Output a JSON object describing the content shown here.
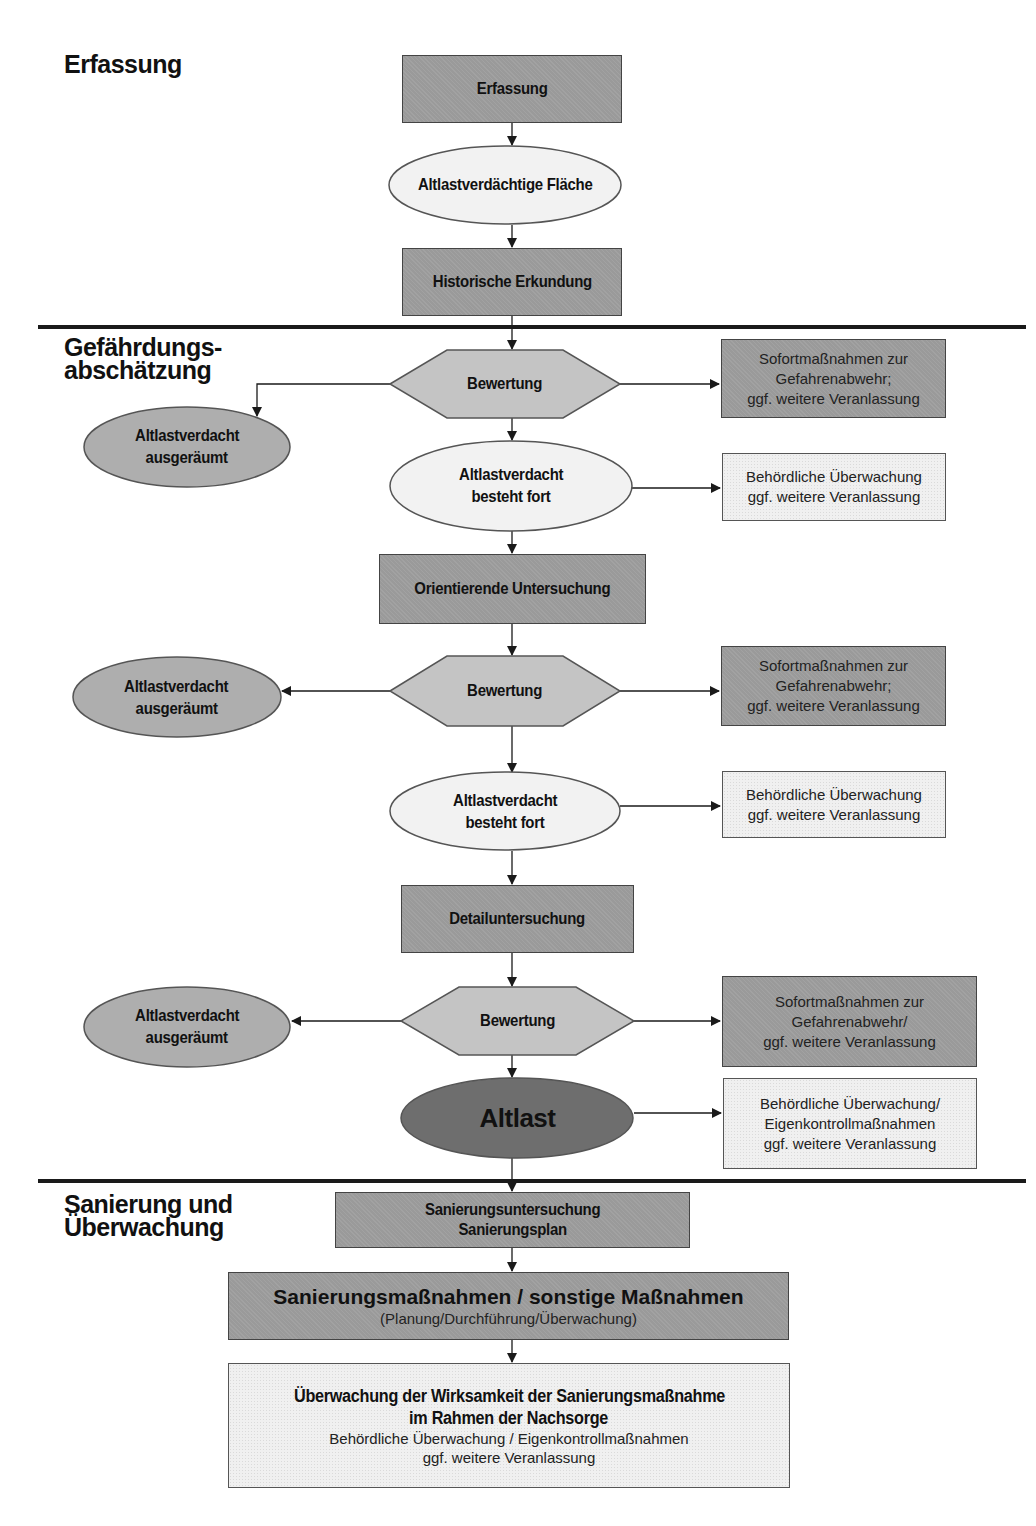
{
  "phases": {
    "erfassung": "Erfassung",
    "gefaehrdung_line1": "Gefährdungs-",
    "gefaehrdung_line2": "abschätzung",
    "sanierung_line1": "Sanierung und",
    "sanierung_line2": "Überwachung"
  },
  "erfassung_section": {
    "erfassung_box": "Erfassung",
    "altlastverdaechtige_flaeche": "Altlastverdächtige Fläche",
    "historische_erkundung": "Historische Erkundung"
  },
  "stage1": {
    "bewertung": "Bewertung",
    "ausgeraeumt_line1": "Altlastverdacht",
    "ausgeraeumt_line2": "ausgeräumt",
    "besteht_line1": "Altlastverdacht",
    "besteht_line2": "besteht fort",
    "sofort_line1": "Sofortmaßnahmen zur",
    "sofort_line2": "Gefahrenabwehr;",
    "sofort_line3": "ggf. weitere Veranlassung",
    "behoerd_line1": "Behördliche Überwachung",
    "behoerd_line2": "ggf. weitere Veranlassung"
  },
  "orientierende_untersuchung": "Orientierende Untersuchung",
  "stage2": {
    "bewertung": "Bewertung",
    "ausgeraeumt_line1": "Altlastverdacht",
    "ausgeraeumt_line2": "ausgeräumt",
    "besteht_line1": "Altlastverdacht",
    "besteht_line2": "besteht fort",
    "sofort_line1": "Sofortmaßnahmen zur",
    "sofort_line2": "Gefahrenabwehr;",
    "sofort_line3": "ggf. weitere Veranlassung",
    "behoerd_line1": "Behördliche Überwachung",
    "behoerd_line2": "ggf. weitere Veranlassung"
  },
  "detailuntersuchung": "Detailuntersuchung",
  "stage3": {
    "bewertung": "Bewertung",
    "ausgeraeumt_line1": "Altlastverdacht",
    "ausgeraeumt_line2": "ausgeräumt",
    "altlast": "Altlast",
    "sofort_line1": "Sofortmaßnahmen zur",
    "sofort_line2": "Gefahrenabwehr/",
    "sofort_line3": "ggf. weitere Veranlassung",
    "behoerd_line1": "Behördliche Überwachung/",
    "behoerd_line2": "Eigenkontrollmaßnahmen",
    "behoerd_line3": "ggf. weitere Veranlassung"
  },
  "sanierung_section": {
    "untersuchung_line1": "Sanierungsuntersuchung",
    "untersuchung_line2": "Sanierungsplan",
    "massnahmen_title": "Sanierungsmaßnahmen  / sonstige Maßnahmen",
    "massnahmen_sub": "(Planung/Durchführung/Überwachung)",
    "nachsorge_line1": "Überwachung der Wirksamkeit der Sanierungsmaßnahme",
    "nachsorge_line2": "im Rahmen der Nachsorge",
    "nachsorge_line3": "Behördliche Überwachung / Eigenkontrollmaßnahmen",
    "nachsorge_line4": "ggf. weitere Veranlassung"
  },
  "colors": {
    "dark_box": "#9a9a9a",
    "light_box": "#f0f0f0",
    "hexagon": "#c4c4c4",
    "ellipse_light": "#f2f2f2",
    "ellipse_mid": "#aeaeae",
    "ellipse_altlast": "#6e6e6e",
    "line": "#1a1a1a"
  }
}
